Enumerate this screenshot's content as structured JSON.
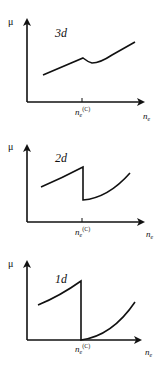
{
  "figure": {
    "panels": [
      {
        "id": "3d",
        "dimension_label": "3d",
        "y_label": "μ",
        "x_label": "n",
        "x_label_sub": "e",
        "critical_label": "n",
        "critical_sub": "e",
        "critical_sup": "(C)",
        "behavior": "smooth chemical potential with small dip near critical density"
      },
      {
        "id": "2d",
        "dimension_label": "2d",
        "y_label": "μ",
        "x_label": "n",
        "x_label_sub": "e",
        "critical_label": "n",
        "critical_sub": "e",
        "critical_sup": "(C)",
        "behavior": "discontinuous drop at critical density"
      },
      {
        "id": "1d",
        "dimension_label": "1d",
        "y_label": "μ",
        "x_label": "n",
        "x_label_sub": "e",
        "critical_label": "n",
        "critical_sub": "e",
        "critical_sup": "(C)",
        "behavior": "drop to zero at critical density then rises"
      }
    ],
    "colors": {
      "line": "#111111",
      "background": "#ffffff"
    }
  }
}
